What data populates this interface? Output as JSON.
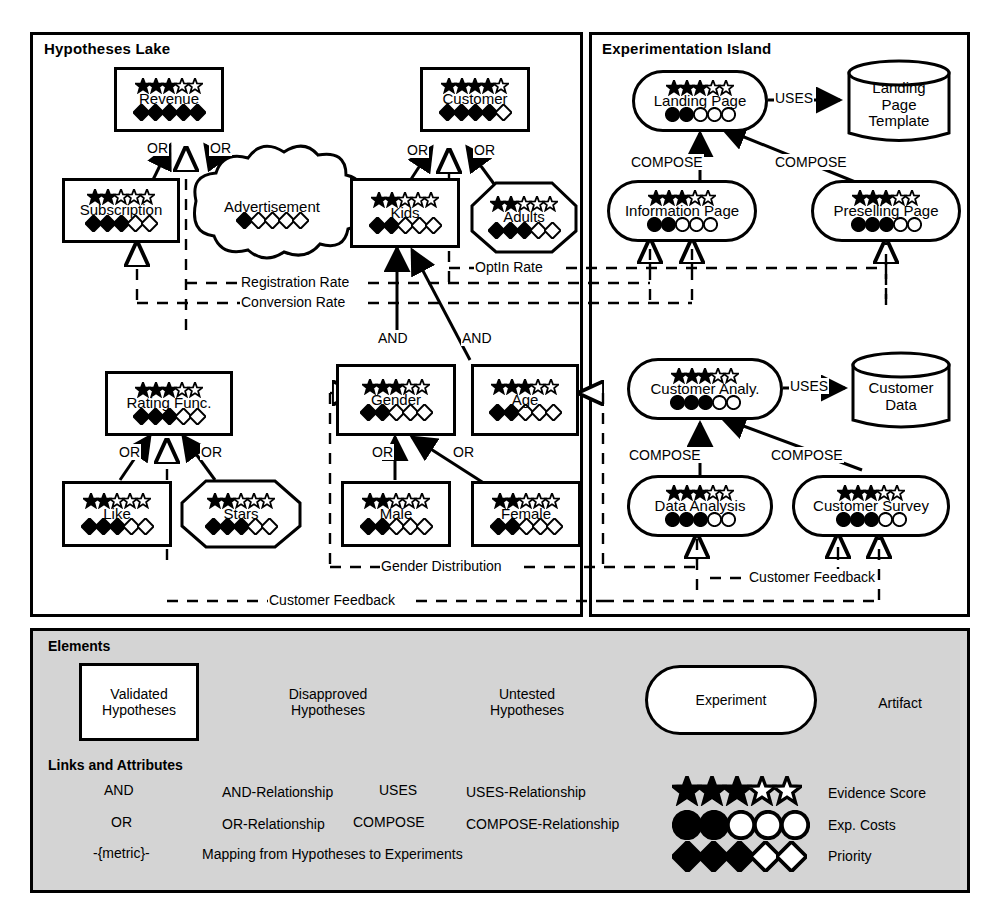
{
  "panels": {
    "hypotheses_lake": "Hypotheses Lake",
    "experimentation_island": "Experimentation Island"
  },
  "colors": {
    "ink": "#000000",
    "paper": "#ffffff",
    "legend_bg": "#d4d4d4"
  },
  "nodes": {
    "revenue": {
      "label": "Revenue",
      "shape": "validated",
      "stars": 3,
      "stars_total": 5,
      "priority": 5,
      "priority_total": 5
    },
    "customer": {
      "label": "Customer",
      "shape": "validated",
      "stars": 4,
      "stars_total": 5,
      "priority": 4,
      "priority_total": 5
    },
    "subscription": {
      "label": "Subscription",
      "shape": "validated",
      "stars": 2,
      "stars_total": 5,
      "priority": 3,
      "priority_total": 5
    },
    "advertisement": {
      "label": "Advertisement",
      "shape": "untested",
      "stars": 0,
      "stars_total": 0,
      "priority": 1,
      "priority_total": 5
    },
    "kids": {
      "label": "Kids",
      "shape": "validated",
      "stars": 2,
      "stars_total": 5,
      "priority": 2,
      "priority_total": 5
    },
    "adults": {
      "label": "Adults",
      "shape": "disapproved",
      "stars": 2,
      "stars_total": 5,
      "priority": 3,
      "priority_total": 5
    },
    "rating_func": {
      "label": "Rating Func.",
      "shape": "validated",
      "stars": 3,
      "stars_total": 5,
      "priority": 3,
      "priority_total": 5
    },
    "like": {
      "label": "Like",
      "shape": "validated",
      "stars": 2,
      "stars_total": 5,
      "priority": 3,
      "priority_total": 5
    },
    "stars_node": {
      "label": "Stars",
      "shape": "disapproved",
      "stars": 2,
      "stars_total": 5,
      "priority": 3,
      "priority_total": 5
    },
    "gender": {
      "label": "Gender",
      "shape": "validated",
      "stars": 3,
      "stars_total": 5,
      "priority": 2,
      "priority_total": 5
    },
    "age": {
      "label": "Age",
      "shape": "validated",
      "stars": 3,
      "stars_total": 5,
      "priority": 2,
      "priority_total": 5
    },
    "male": {
      "label": "Male",
      "shape": "validated",
      "stars": 2,
      "stars_total": 5,
      "priority": 2,
      "priority_total": 5
    },
    "female": {
      "label": "Female",
      "shape": "validated",
      "stars": 2,
      "stars_total": 5,
      "priority": 2,
      "priority_total": 5
    },
    "landing_page": {
      "label": "Landing Page",
      "shape": "experiment",
      "stars": 3,
      "stars_total": 5,
      "costs": 2,
      "costs_total": 5
    },
    "information_page": {
      "label": "Information Page",
      "shape": "experiment",
      "stars": 3,
      "stars_total": 5,
      "costs": 2,
      "costs_total": 5
    },
    "preselling_page": {
      "label": "Preselling Page",
      "shape": "experiment",
      "stars": 3,
      "stars_total": 5,
      "costs": 3,
      "costs_total": 5
    },
    "customer_analysis": {
      "label": "Customer Analy.",
      "shape": "experiment",
      "stars": 3,
      "stars_total": 5,
      "costs": 3,
      "costs_total": 5
    },
    "data_analysis": {
      "label": "Data Analysis",
      "shape": "experiment",
      "stars": 3,
      "stars_total": 5,
      "costs": 3,
      "costs_total": 5
    },
    "customer_survey": {
      "label": "Customer Survey",
      "shape": "experiment",
      "stars": 3,
      "stars_total": 5,
      "costs": 3,
      "costs_total": 5
    },
    "landing_page_template": {
      "label": "Landing\nPage\nTemplate",
      "shape": "artifact"
    },
    "customer_data": {
      "label": "Customer\nData",
      "shape": "artifact"
    }
  },
  "edge_labels": {
    "or": "OR",
    "and": "AND",
    "uses": "USES",
    "compose": "COMPOSE"
  },
  "metrics": {
    "registration_rate": "Registration Rate",
    "conversion_rate": "Conversion Rate",
    "optin_rate": "OptIn Rate",
    "gender_distribution": "Gender Distribution",
    "customer_feedback": "Customer Feedback"
  },
  "legend": {
    "elements_title": "Elements",
    "links_title": "Links and Attributes",
    "elements": [
      {
        "key": "validated",
        "label": "Validated\nHypotheses"
      },
      {
        "key": "disapproved",
        "label": "Disapproved\nHypotheses"
      },
      {
        "key": "untested",
        "label": "Untested\nHypotheses"
      },
      {
        "key": "experiment",
        "label": "Experiment"
      },
      {
        "key": "artifact",
        "label": "Artifact"
      }
    ],
    "links": [
      {
        "key": "and",
        "edge_label": "AND",
        "text": "AND-Relationship"
      },
      {
        "key": "or",
        "edge_label": "OR",
        "text": "OR-Relationship"
      },
      {
        "key": "mapping",
        "edge_label": "-{metric}-",
        "text": "Mapping from Hypotheses to Experiments"
      },
      {
        "key": "uses",
        "edge_label": "USES",
        "text": "USES-Relationship"
      },
      {
        "key": "compose",
        "edge_label": "COMPOSE",
        "text": "COMPOSE-Relationship"
      }
    ],
    "attributes": [
      {
        "key": "evidence_score",
        "label": "Evidence Score",
        "filled": 3,
        "total": 5,
        "glyph": "star"
      },
      {
        "key": "exp_costs",
        "label": "Exp. Costs",
        "filled": 2,
        "total": 5,
        "glyph": "circle"
      },
      {
        "key": "priority",
        "label": "Priority",
        "filled": 3,
        "total": 5,
        "glyph": "diamond"
      }
    ]
  }
}
